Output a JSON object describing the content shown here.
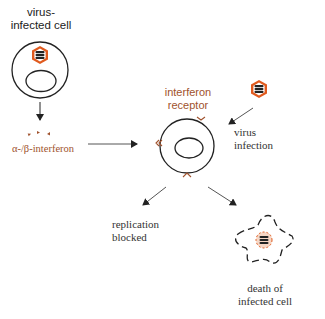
{
  "diagram": {
    "labels": {
      "infected_cell": [
        "virus-",
        "infected cell"
      ],
      "interferon": "α-/β-interferon",
      "receptor": [
        "interferon",
        "receptor"
      ],
      "virus_infection": [
        "virus",
        "infection"
      ],
      "replication_blocked": [
        "replication",
        "blocked"
      ],
      "cell_death": [
        "death of",
        "infected cell"
      ]
    },
    "colors": {
      "stroke": "#222222",
      "virus_accent": "#e05a1e",
      "interferon_accent": "#a0522d",
      "arrow": "#555555"
    },
    "nodes": [
      {
        "id": "infected-cell",
        "label": "virus-infected cell"
      },
      {
        "id": "interferon",
        "label": "α-/β-interferon"
      },
      {
        "id": "target-cell",
        "label": "interferon receptor"
      },
      {
        "id": "virus",
        "label": "virus infection"
      },
      {
        "id": "outcome-blocked",
        "label": "replication blocked"
      },
      {
        "id": "outcome-death",
        "label": "death of infected cell"
      }
    ],
    "edges": [
      {
        "from": "infected-cell",
        "to": "interferon"
      },
      {
        "from": "interferon",
        "to": "target-cell"
      },
      {
        "from": "virus",
        "to": "target-cell"
      },
      {
        "from": "target-cell",
        "to": "outcome-blocked"
      },
      {
        "from": "target-cell",
        "to": "outcome-death"
      }
    ]
  }
}
